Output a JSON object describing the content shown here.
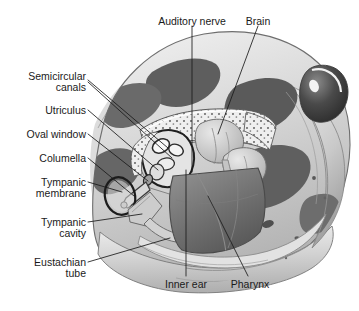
{
  "figure": {
    "background_color": "#ffffff",
    "ink_color": "#1a1a1a",
    "width": 359,
    "height": 311
  },
  "labels": {
    "auditory_nerve": "Auditory nerve",
    "brain": "Brain",
    "semicircular_canals_line1": "Semicircular",
    "semicircular_canals_line2": "canals",
    "utriculus": "Utriculus",
    "oval_window": "Oval window",
    "columella": "Columella",
    "tympanic_membrane_line1": "Tympanic",
    "tympanic_membrane_line2": "membrane",
    "tympanic_cavity_line1": "Tympanic",
    "tympanic_cavity_line2": "cavity",
    "eustachian_tube_line1": "Eustachian",
    "eustachian_tube_line2": "tube",
    "inner_ear": "Inner ear",
    "pharynx": "Pharynx"
  },
  "label_list": [
    {
      "name": "auditory-nerve",
      "text": "Auditory nerve",
      "side": "top"
    },
    {
      "name": "brain",
      "text": "Brain",
      "side": "top"
    },
    {
      "name": "semicircular-canals",
      "text": "Semicircular canals",
      "side": "left"
    },
    {
      "name": "utriculus",
      "text": "Utriculus",
      "side": "left"
    },
    {
      "name": "oval-window",
      "text": "Oval window",
      "side": "left"
    },
    {
      "name": "columella",
      "text": "Columella",
      "side": "left"
    },
    {
      "name": "tympanic-membrane",
      "text": "Tympanic membrane",
      "side": "left"
    },
    {
      "name": "tympanic-cavity",
      "text": "Tympanic cavity",
      "side": "left"
    },
    {
      "name": "eustachian-tube",
      "text": "Eustachian tube",
      "side": "left"
    },
    {
      "name": "inner-ear",
      "text": "Inner ear",
      "side": "bottom"
    },
    {
      "name": "pharynx",
      "text": "Pharynx",
      "side": "bottom"
    }
  ]
}
